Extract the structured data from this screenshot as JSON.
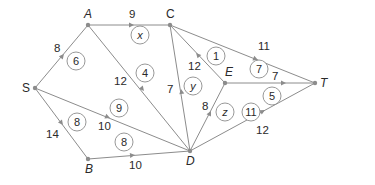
{
  "diagram": {
    "type": "flow-network",
    "colors": {
      "edge": "#8c8c8c",
      "text": "#2a2a2a",
      "background": "#ffffff"
    },
    "nodes": {
      "S": {
        "label": "S",
        "x": 35,
        "y": 88
      },
      "A": {
        "label": "A",
        "x": 88,
        "y": 25
      },
      "C": {
        "label": "C",
        "x": 170,
        "y": 25
      },
      "E": {
        "label": "E",
        "x": 225,
        "y": 83
      },
      "T": {
        "label": "T",
        "x": 315,
        "y": 83
      },
      "B": {
        "label": "B",
        "x": 88,
        "y": 159
      },
      "D": {
        "label": "D",
        "x": 190,
        "y": 151
      }
    },
    "edges": [
      {
        "from": "S",
        "to": "A",
        "capacity": "8",
        "flow": "6"
      },
      {
        "from": "A",
        "to": "C",
        "capacity": "9",
        "flow": "x"
      },
      {
        "from": "A",
        "to": "D",
        "capacity": "12",
        "flow": "4"
      },
      {
        "from": "S",
        "to": "D",
        "capacity": "10",
        "flow": "9"
      },
      {
        "from": "S",
        "to": "B",
        "capacity": "14",
        "flow": "8"
      },
      {
        "from": "B",
        "to": "D",
        "capacity": "10",
        "flow": "8"
      },
      {
        "from": "D",
        "to": "C",
        "capacity": "7",
        "flow": "y"
      },
      {
        "from": "E",
        "to": "C",
        "capacity": "12",
        "flow": "1"
      },
      {
        "from": "C",
        "to": "T",
        "capacity": "11",
        "flow": "7"
      },
      {
        "from": "E",
        "to": "T",
        "capacity": "7",
        "flow": "5"
      },
      {
        "from": "D",
        "to": "E",
        "capacity": "8",
        "flow": "z"
      },
      {
        "from": "D",
        "to": "T",
        "capacity": "12",
        "flow": "11"
      }
    ]
  }
}
